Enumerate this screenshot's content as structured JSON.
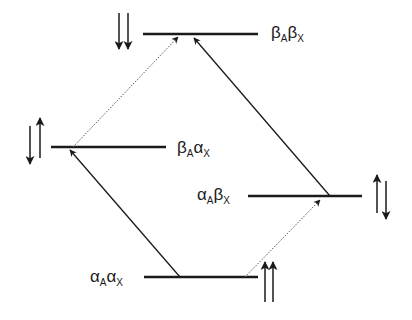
{
  "colors": {
    "line": "#1a1a1a",
    "background": "#ffffff"
  },
  "levels": [
    {
      "id": "bb",
      "spin_a": "β",
      "sub_a": "A",
      "spin_x": "β",
      "sub_x": "X",
      "spin_arrows": "down-down"
    },
    {
      "id": "ba",
      "spin_a": "β",
      "sub_a": "A",
      "spin_x": "α",
      "sub_x": "X",
      "spin_arrows": "down-up"
    },
    {
      "id": "ab",
      "spin_a": "α",
      "sub_a": "A",
      "spin_x": "β",
      "sub_x": "X",
      "spin_arrows": "up-down"
    },
    {
      "id": "aa",
      "spin_a": "α",
      "sub_a": "A",
      "spin_x": "α",
      "sub_x": "X",
      "spin_arrows": "up-up"
    }
  ],
  "transitions": [
    {
      "from": "aa",
      "to": "ba",
      "style": "solid"
    },
    {
      "from": "ba",
      "to": "bb",
      "style": "dotted"
    },
    {
      "from": "aa",
      "to": "ab",
      "style": "dotted"
    },
    {
      "from": "ab",
      "to": "bb",
      "style": "solid"
    }
  ]
}
